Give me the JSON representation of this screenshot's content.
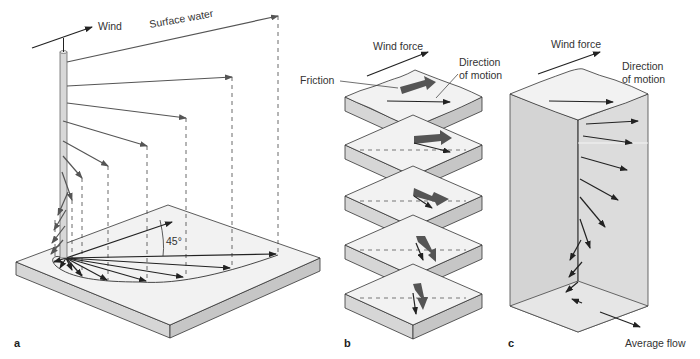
{
  "figure": {
    "panels": [
      {
        "id": "a",
        "label": "a",
        "texts": {
          "wind": "Wind",
          "surface_water": "Surface water",
          "angle": "45°"
        }
      },
      {
        "id": "b",
        "label": "b",
        "texts": {
          "wind_force": "Wind force",
          "friction": "Friction",
          "direction_of_motion_line1": "Direction",
          "direction_of_motion_line2": "of motion"
        },
        "layers": 5
      },
      {
        "id": "c",
        "label": "c",
        "texts": {
          "wind_force": "Wind force",
          "direction_of_motion_line1": "Direction",
          "direction_of_motion_line2": "of motion",
          "average_flow": "Average flow"
        }
      }
    ],
    "colors": {
      "top_face": "#f2f2f2",
      "side_left": "#d6d6d6",
      "side_right": "#c6c6c6",
      "arrow_dark": "#222222",
      "arrow_gray": "#555555",
      "thick_arrow": "#555555",
      "column": "#dcdcdc"
    }
  }
}
